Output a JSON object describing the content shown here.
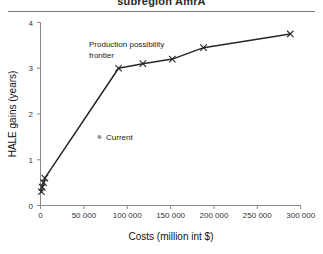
{
  "figure": {
    "title": "subregion AmrA",
    "has_title_rule": true
  },
  "chart_data": {
    "type": "line",
    "title": "subregion AmrA",
    "xlabel": "Costs (million int $)",
    "ylabel": "HALE gains (years)",
    "xlim": [
      0,
      300000
    ],
    "ylim": [
      0,
      4
    ],
    "grid": false,
    "legend_position": "inside-left",
    "xticks": [
      0,
      50000,
      100000,
      150000,
      200000,
      250000,
      300000
    ],
    "xticklabels": [
      "0",
      "50 000",
      "100 000",
      "150 000",
      "200 000",
      "250 000",
      "300 000"
    ],
    "yticks": [
      0,
      1,
      2,
      3,
      4
    ],
    "yticklabels": [
      "0",
      "1",
      "2",
      "3",
      "4"
    ],
    "series": [
      {
        "name": "Production possibility frontier",
        "marker": "x",
        "x": [
          1000,
          2000,
          3500,
          5000,
          90000,
          118000,
          152000,
          188000,
          288000
        ],
        "y": [
          0.3,
          0.4,
          0.5,
          0.6,
          3.0,
          3.1,
          3.2,
          3.45,
          3.75
        ]
      }
    ],
    "annotations": [
      {
        "name": "ppf-label",
        "lines": [
          "Production possibility",
          "frontier"
        ],
        "x": 73000,
        "y": 3.75
      },
      {
        "name": "current-legend",
        "text": "Current",
        "marker": "circle",
        "x": 80000,
        "y": 1.68
      }
    ]
  },
  "axes": {
    "x_title": "Costs (million int $)",
    "y_title": "HALE gains (years)"
  },
  "legend": {
    "current_label": "Current"
  },
  "annotation": {
    "ppf_line1": "Production possibility",
    "ppf_line2": "frontier"
  },
  "colors": {
    "line": "#262626",
    "axis": "#8a8a8a",
    "text": "#1a1a1a",
    "legend_dot": "#9a9a9a"
  }
}
